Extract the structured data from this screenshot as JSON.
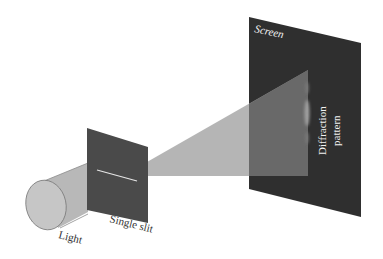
{
  "diagram": {
    "labels": {
      "screen": "Screen",
      "pattern_line1": "Diffraction",
      "pattern_line2": "pattern",
      "slit": "Single slit",
      "light": "Light"
    },
    "colors": {
      "background": "#ffffff",
      "screen": "#2f2f2f",
      "slit_panel": "#4a4a4a",
      "light_beam": "#b0b0b0",
      "cylinder_end": "#c4c4c4",
      "slit_line": "#e6e6e6",
      "label_on_dark": "#f2f2f2",
      "label_on_light": "#333333",
      "fringe": "#9a9a9a"
    }
  }
}
